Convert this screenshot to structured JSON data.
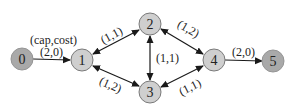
{
  "diagram": {
    "type": "flow-network",
    "legend": "(cap,cost)",
    "colors": {
      "terminal_fill": "#a9a9a9",
      "terminal_stroke": "#8c8c8c",
      "node_fill": "#cfcfcf",
      "node_stroke": "#7a7a7a",
      "edge": "#1a1a1a"
    },
    "nodes": [
      {
        "id": "0",
        "label": "0",
        "x": 22,
        "y": 59,
        "terminal": true
      },
      {
        "id": "1",
        "label": "1",
        "x": 82,
        "y": 60,
        "terminal": false
      },
      {
        "id": "2",
        "label": "2",
        "x": 150,
        "y": 24,
        "terminal": false
      },
      {
        "id": "3",
        "label": "3",
        "x": 150,
        "y": 92,
        "terminal": false
      },
      {
        "id": "4",
        "label": "4",
        "x": 214,
        "y": 60,
        "terminal": false
      },
      {
        "id": "5",
        "label": "5",
        "x": 273,
        "y": 61,
        "terminal": true
      }
    ],
    "edges": [
      {
        "from": "0",
        "to": "1",
        "label": "(2,0)",
        "bidirectional": false
      },
      {
        "from": "1",
        "to": "2",
        "label": "(1,1)",
        "bidirectional": true
      },
      {
        "from": "1",
        "to": "3",
        "label": "(1,2)",
        "bidirectional": true
      },
      {
        "from": "2",
        "to": "3",
        "label": "(1,1)",
        "bidirectional": true
      },
      {
        "from": "2",
        "to": "4",
        "label": "(1,2)",
        "bidirectional": true
      },
      {
        "from": "3",
        "to": "4",
        "label": "(1,1)",
        "bidirectional": true
      },
      {
        "from": "4",
        "to": "5",
        "label": "(2,0)",
        "bidirectional": false
      }
    ]
  }
}
